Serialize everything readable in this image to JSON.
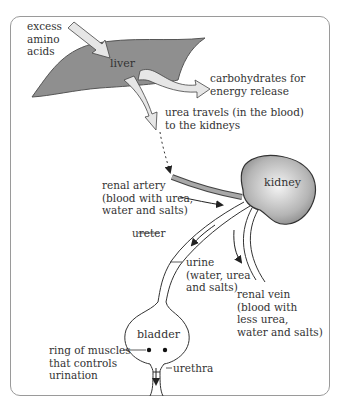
{
  "diagram": {
    "type": "flow diagram",
    "organs": {
      "liver": "liver",
      "kidney": "kidney",
      "bladder": "bladder"
    },
    "labels": {
      "input": "excess\namino\nacids",
      "carbs": "carbohydrates for\nenergy release",
      "urea": "urea travels (in the blood)\nto the kidneys",
      "renal_artery": "renal artery\n(blood with urea,\nwater and salts)",
      "ureter": "ureter",
      "urine": "urine\n(water, urea\nand salts)",
      "renal_vein": "renal vein\n(blood with\nless urea,\nwater and salts)",
      "sphincter": "ring of muscles\nthat controls\nurination",
      "urethra": "urethra"
    },
    "colors": {
      "liver_fill": "#8f8f8f",
      "kidney_fill": "#a9a9a9",
      "arrow_fill": "#e6e6e6",
      "frame": "#9a9a9a",
      "line": "#333333"
    }
  }
}
